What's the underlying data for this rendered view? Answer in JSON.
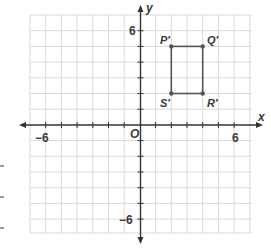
{
  "diagram": {
    "type": "coordinate-plane",
    "x_axis_label": "x",
    "y_axis_label": "y",
    "origin_label": "O",
    "tick_labels": {
      "x_neg": "−6",
      "x_pos": "6",
      "y_pos": "6",
      "y_neg": "−6"
    },
    "range": {
      "x": [
        -7,
        7
      ],
      "y": [
        -7,
        7
      ]
    },
    "points": [
      {
        "label": "P′",
        "x": 2,
        "y": 5
      },
      {
        "label": "Q′",
        "x": 4,
        "y": 5
      },
      {
        "label": "R′",
        "x": 4,
        "y": 2
      },
      {
        "label": "S′",
        "x": 2,
        "y": 2
      }
    ],
    "shape": "rectangle P′Q′R′S′",
    "colors": {
      "grid": "#d8d8d8",
      "axis": "#333333",
      "shape": "#555555"
    }
  }
}
